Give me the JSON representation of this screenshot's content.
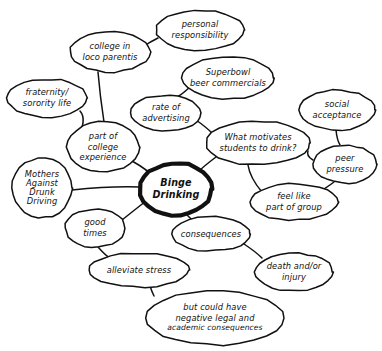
{
  "diagram": {
    "style": "hand-drawn concept map",
    "ink_color": "#111111",
    "background_color": "#ffffff",
    "central_node": {
      "id": "binge-drinking",
      "lines": [
        "Binge",
        "Drinking"
      ],
      "cx": 176,
      "cy": 189,
      "rx": 36,
      "ry": 26
    },
    "nodes": [
      {
        "id": "personal-responsibility",
        "lines": [
          "personal",
          "responsibility"
        ],
        "cx": 200,
        "cy": 30,
        "rx": 44,
        "ry": 20
      },
      {
        "id": "college-in-loco-parentis",
        "lines": [
          "college in",
          "loco parentis"
        ],
        "cx": 110,
        "cy": 52,
        "rx": 40,
        "ry": 20
      },
      {
        "id": "superbowl-beer-commercials",
        "lines": [
          "Superbowl",
          "beer commercials"
        ],
        "cx": 228,
        "cy": 78,
        "rx": 46,
        "ry": 21
      },
      {
        "id": "fraternity-sorority-life",
        "lines": [
          "fraternity/",
          "sorority life"
        ],
        "cx": 47,
        "cy": 98,
        "rx": 40,
        "ry": 19
      },
      {
        "id": "rate-of-advertising",
        "lines": [
          "rate of",
          "advertising"
        ],
        "cx": 166,
        "cy": 113,
        "rx": 35,
        "ry": 18
      },
      {
        "id": "social-acceptance",
        "lines": [
          "social",
          "acceptance"
        ],
        "cx": 337,
        "cy": 110,
        "rx": 38,
        "ry": 20
      },
      {
        "id": "part-of-college-experience",
        "lines": [
          "part of",
          "college",
          "experience"
        ],
        "cx": 103,
        "cy": 147,
        "rx": 36,
        "ry": 25
      },
      {
        "id": "what-motivates-students-to-drink",
        "lines": [
          "What motivates",
          "students to drink?"
        ],
        "cx": 258,
        "cy": 143,
        "rx": 52,
        "ry": 22
      },
      {
        "id": "peer-pressure",
        "lines": [
          "peer",
          "pressure"
        ],
        "cx": 345,
        "cy": 164,
        "rx": 32,
        "ry": 19
      },
      {
        "id": "mothers-against-drunk-driving",
        "lines": [
          "Mothers",
          "Against",
          "Drunk",
          "Driving"
        ],
        "cx": 42,
        "cy": 188,
        "rx": 30,
        "ry": 30
      },
      {
        "id": "feel-like-part-of-group",
        "lines": [
          "feel like",
          "part of group"
        ],
        "cx": 294,
        "cy": 202,
        "rx": 44,
        "ry": 18
      },
      {
        "id": "good-times",
        "lines": [
          "good",
          "times"
        ],
        "cx": 95,
        "cy": 228,
        "rx": 30,
        "ry": 19
      },
      {
        "id": "consequences",
        "lines": [
          "consequences"
        ],
        "cx": 211,
        "cy": 234,
        "rx": 39,
        "ry": 17
      },
      {
        "id": "death-and-or-injury",
        "lines": [
          "death and/or",
          "injury"
        ],
        "cx": 294,
        "cy": 272,
        "rx": 39,
        "ry": 19
      },
      {
        "id": "alleviate-stress",
        "lines": [
          "alleviate stress"
        ],
        "cx": 139,
        "cy": 270,
        "rx": 50,
        "ry": 17
      },
      {
        "id": "but-could-have-negative-legal-and-academic-consequences",
        "lines": [
          "but could have",
          "negative legal and",
          "academic consequences"
        ],
        "cx": 215,
        "cy": 318,
        "rx": 69,
        "ry": 27
      }
    ],
    "edges": [
      {
        "id": "edge-personal-responsibility-college-in-loco-parentis",
        "from": "personal-responsibility",
        "to": "college-in-loco-parentis",
        "path": "M 158,38 Q 150,42 144,46"
      },
      {
        "id": "edge-college-in-loco-parentis-part-of-college-experience",
        "from": "college-in-loco-parentis",
        "to": "part-of-college-experience",
        "path": "M 98,72 Q 100,96 104,122"
      },
      {
        "id": "edge-superbowl-rate-of-advertising",
        "from": "superbowl-beer-commercials",
        "to": "rate-of-advertising",
        "path": "M 190,87 Q 180,96 177,97"
      },
      {
        "id": "edge-rate-of-advertising-what-motivates",
        "from": "rate-of-advertising",
        "to": "what-motivates-students-to-drink",
        "path": "M 196,120 Q 206,127 212,133"
      },
      {
        "id": "edge-fraternity-part-of-college-experience",
        "from": "fraternity-sorority-life",
        "to": "part-of-college-experience",
        "path": "M 80,111 Q 88,120 76,140"
      },
      {
        "id": "edge-part-of-college-experience-central",
        "from": "part-of-college-experience",
        "to": "binge-drinking",
        "path": "M 132,161 Q 148,170 152,176"
      },
      {
        "id": "edge-what-motivates-central",
        "from": "what-motivates-students-to-drink",
        "to": "binge-drinking",
        "path": "M 216,157 Q 204,166 198,172"
      },
      {
        "id": "edge-social-acceptance-peer-pressure",
        "from": "social-acceptance",
        "to": "peer-pressure",
        "path": "M 336,130 Q 337,140 340,145"
      },
      {
        "id": "edge-peer-pressure-what-motivates",
        "from": "peer-pressure",
        "to": "what-motivates-students-to-drink",
        "path": "M 313,160 Q 306,156 308,151"
      },
      {
        "id": "edge-peer-pressure-feel-like-part-of-group",
        "from": "peer-pressure",
        "to": "feel-like-part-of-group",
        "path": "M 334,182 Q 326,188 322,190"
      },
      {
        "id": "edge-feel-like-part-of-group-what-motivates",
        "from": "feel-like-part-of-group",
        "to": "what-motivates-students-to-drink",
        "path": "M 262,192 Q 250,178 248,165"
      },
      {
        "id": "edge-mothers-against-drunk-driving-central",
        "from": "mothers-against-drunk-driving",
        "to": "binge-drinking",
        "path": "M 72,190 Q 110,186 140,187"
      },
      {
        "id": "edge-central-consequences",
        "from": "binge-drinking",
        "to": "consequences",
        "path": "M 186,214 Q 196,224 198,224"
      },
      {
        "id": "edge-central-good-times",
        "from": "binge-drinking",
        "to": "good-times",
        "path": "M 146,201 Q 132,212 122,220"
      },
      {
        "id": "edge-good-times-alleviate-stress",
        "from": "good-times",
        "to": "alleviate-stress",
        "path": "M 98,247 Q 106,256 110,258"
      },
      {
        "id": "edge-consequences-death-and-or-injury",
        "from": "consequences",
        "to": "death-and-or-injury",
        "path": "M 244,244 Q 256,252 262,258"
      },
      {
        "id": "edge-alleviate-stress-but-could-have",
        "from": "alleviate-stress",
        "to": "but-could-have-negative-legal-and-academic-consequences",
        "path": "M 150,286 Q 152,292 154,296"
      }
    ]
  }
}
